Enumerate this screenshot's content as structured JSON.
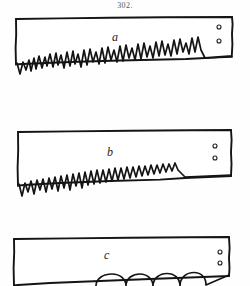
{
  "plate": {
    "figure_number": "302.",
    "background_color": "#fefefe",
    "ink_color": "#141414",
    "width": 250,
    "height": 286,
    "medium": "engraving-line-drawing"
  },
  "figures": [
    {
      "label": "a",
      "object": "saw-blade",
      "label_position": {
        "x": 112,
        "y": 31
      },
      "blade": {
        "top_edge": {
          "x1": 16,
          "y1": 19,
          "x2": 232,
          "y2": 17
        },
        "heel_x": 16,
        "toe_x": 232,
        "rivet_holes": 2,
        "rivets": [
          {
            "cx": 219,
            "cy": 27,
            "r": 2.0
          },
          {
            "cx": 219,
            "cy": 41,
            "r": 2.0
          }
        ],
        "tooth_style": "irregular-ragged",
        "tooth_count": 28,
        "teeth_band": {
          "y_top": 52,
          "y_bottom": 78
        }
      }
    },
    {
      "label": "b",
      "object": "saw-blade",
      "label_position": {
        "x": 107,
        "y": 146
      },
      "blade": {
        "top_edge": {
          "x1": 18,
          "y1": 132,
          "x2": 231,
          "y2": 130
        },
        "heel_x": 18,
        "toe_x": 231,
        "rivet_holes": 2,
        "rivets": [
          {
            "cx": 215,
            "cy": 146,
            "r": 2.0
          },
          {
            "cx": 215,
            "cy": 158,
            "r": 2.0
          }
        ],
        "tooth_style": "irregular-left-regular-right",
        "tooth_count": 30,
        "teeth_band": {
          "y_top": 172,
          "y_bottom": 196
        }
      }
    },
    {
      "label": "c",
      "object": "saw-blade",
      "label_position": {
        "x": 104,
        "y": 249
      },
      "blade": {
        "top_edge": {
          "x1": 14,
          "y1": 239,
          "x2": 229,
          "y2": 237
        },
        "heel_x": 14,
        "toe_x": 229,
        "rivet_holes": 2,
        "rivets": [
          {
            "cx": 220,
            "cy": 252,
            "r": 2.0
          },
          {
            "cx": 220,
            "cy": 263,
            "r": 2.0
          }
        ],
        "tooth_style": "large-rounded-scalloped",
        "tooth_count": 7,
        "teeth_band": {
          "y_top": 272,
          "y_bottom": 286
        },
        "cropped_at_bottom": true
      }
    }
  ],
  "icons": {
    "rivet_hole": "small-circle-icon"
  }
}
